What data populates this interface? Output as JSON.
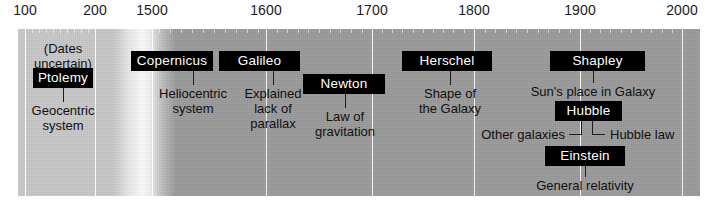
{
  "figure": {
    "band_color": "#9a9a9a",
    "ancient_color": "#c8c8c8",
    "box_color": "#000000",
    "box_text_color": "#ffffff",
    "gridline_color": "#ffffff"
  },
  "axis": {
    "labels": [
      {
        "text": "100",
        "x": 25
      },
      {
        "text": "200",
        "x": 95
      },
      {
        "text": "1500",
        "x": 152
      },
      {
        "text": "1600",
        "x": 266
      },
      {
        "text": "1700",
        "x": 372
      },
      {
        "text": "1800",
        "x": 474
      },
      {
        "text": "1900",
        "x": 580
      },
      {
        "text": "2000",
        "x": 682
      }
    ],
    "gridlines": [
      25,
      95,
      152,
      266,
      372,
      474,
      580,
      682
    ],
    "minor_ticks": [
      32,
      39,
      46,
      53,
      60,
      67,
      74,
      81,
      88,
      159,
      170,
      181,
      192,
      203,
      214,
      225,
      236,
      247,
      258,
      277,
      287,
      298,
      308,
      319,
      330,
      340,
      351,
      362,
      382,
      392,
      402,
      413,
      423,
      433,
      443,
      453,
      464,
      485,
      495,
      506,
      516,
      527,
      538,
      548,
      559,
      570,
      590,
      600,
      610,
      621,
      631,
      641,
      651,
      662,
      672
    ]
  },
  "notes": [
    {
      "id": "dates-uncertain",
      "text": "(Dates\nuncertain)",
      "x": 63,
      "y": 16
    }
  ],
  "entries": [
    {
      "id": "ptolemy",
      "name": "Ptolemy",
      "caption": "Geocentric\nsystem",
      "box": {
        "x": 33,
        "y": 39,
        "width": 60
      },
      "connector": {
        "x": 63,
        "y": 59,
        "height": 14
      },
      "caption_pos": {
        "x": 63,
        "y": 74
      }
    },
    {
      "id": "copernicus",
      "name": "Copernicus",
      "caption": "Heliocentric\nsystem",
      "box": {
        "x": 131,
        "y": 22,
        "width": 82
      },
      "connector": {
        "x": 193,
        "y": 42,
        "height": 14
      },
      "caption_pos": {
        "x": 193,
        "y": 57
      }
    },
    {
      "id": "galileo",
      "name": "Galileo",
      "caption": "Explained\nlack of\nparallax",
      "box": {
        "x": 219,
        "y": 22,
        "width": 81
      },
      "connector": {
        "x": 273,
        "y": 42,
        "height": 14
      },
      "caption_pos": {
        "x": 273,
        "y": 57
      }
    },
    {
      "id": "newton",
      "name": "Newton",
      "caption": "Law of\ngravitation",
      "box": {
        "x": 303,
        "y": 45,
        "width": 82
      },
      "connector": {
        "x": 345,
        "y": 65,
        "height": 14
      },
      "caption_pos": {
        "x": 345,
        "y": 80
      }
    },
    {
      "id": "herschel",
      "name": "Herschel",
      "caption": "Shape of\nthe Galaxy",
      "box": {
        "x": 402,
        "y": 22,
        "width": 90
      },
      "connector": {
        "x": 450,
        "y": 42,
        "height": 14
      },
      "caption_pos": {
        "x": 450,
        "y": 57
      }
    },
    {
      "id": "shapley",
      "name": "Shapley",
      "caption": "Sun's place in Galaxy",
      "box": {
        "x": 550,
        "y": 22,
        "width": 95
      },
      "connector": {
        "x": 593,
        "y": 42,
        "height": 12
      },
      "caption_pos": {
        "x": 593,
        "y": 55
      }
    },
    {
      "id": "hubble",
      "name": "Hubble",
      "caption_left": "Other galaxies",
      "caption_right": "Hubble law",
      "box": {
        "x": 555,
        "y": 72,
        "width": 67
      },
      "caption_pos": {
        "y": 101
      }
    },
    {
      "id": "einstein",
      "name": "Einstein",
      "caption": "General relativity",
      "box": {
        "x": 545,
        "y": 117,
        "width": 80
      },
      "connector": {
        "x": 585,
        "y": 137,
        "height": 11
      },
      "caption_pos": {
        "x": 585,
        "y": 149
      }
    }
  ]
}
